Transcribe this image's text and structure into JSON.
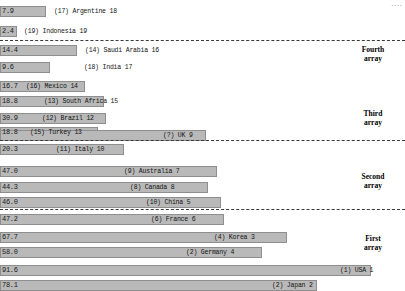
{
  "chart_data": {
    "type": "bar",
    "title": "",
    "xlabel": "",
    "ylabel": "",
    "orientation": "horizontal",
    "xlim": [
      0,
      100
    ],
    "grid": false,
    "legend": "none",
    "note_corner": "",
    "categories": [
      "Argentina",
      "Indonesia",
      "Saudi Arabia",
      "India",
      "Mexico",
      "South Africa",
      "Brazil",
      "Turkey",
      "UK",
      "Italy",
      "Australia",
      "Canada",
      "China",
      "France",
      "Korea",
      "Germany",
      "USA",
      "Japan"
    ],
    "values": [
      7.9,
      2.4,
      14.4,
      9.6,
      16.7,
      18.8,
      30.9,
      18.8,
      28.0,
      20.3,
      47.0,
      44.3,
      46.0,
      47.2,
      67.7,
      58.0,
      91.6,
      78.1
    ]
  },
  "rows": [
    {
      "value": "7.9",
      "label": "(17) Argentine 18",
      "bar_w": 46,
      "lbl_x": 54,
      "y": 6,
      "group": "fourth"
    },
    {
      "value": "2.4",
      "label": "(19) Indonesia 19",
      "bar_w": 17,
      "lbl_x": 24,
      "y": 26,
      "group": "fourth"
    },
    {
      "value": "14.4",
      "label": "(14) Saudi Arabia 16",
      "bar_w": 77,
      "lbl_x": 85,
      "y": 45,
      "group": "fourth"
    },
    {
      "value": "9.6",
      "label": "(18) India 17",
      "bar_w": 50,
      "lbl_x": 84,
      "y": 62,
      "group": "fourth"
    },
    {
      "value": "16.7",
      "label": "(16) Mexico 14",
      "bar_w": 85,
      "lbl_x": 26,
      "y": 81,
      "group": "third"
    },
    {
      "value": "18.8",
      "label": "(13) South Africa 15",
      "bar_w": 104,
      "lbl_x": 44,
      "y": 96,
      "group": "third"
    },
    {
      "value": "30.9",
      "label": "(12) Brazil 12",
      "bar_w": 106,
      "lbl_x": 42,
      "y": 113,
      "group": "third"
    },
    {
      "value": "18.8",
      "label": "(15) Turkey 13",
      "bar_w": 98,
      "lbl_x": 30,
      "y": 127,
      "group": "third"
    },
    {
      "value": "",
      "label": "(?) UK 9",
      "bar_w": 206,
      "lbl_x": 163,
      "y": 130,
      "group": "third"
    },
    {
      "value": "20.3",
      "label": "(11) Italy 10",
      "bar_w": 124,
      "lbl_x": 56,
      "y": 144,
      "group": "third"
    },
    {
      "value": "47.0",
      "label": "(9) Australia 7",
      "bar_w": 217,
      "lbl_x": 124,
      "y": 166,
      "group": "second"
    },
    {
      "value": "44.3",
      "label": "(8) Canada 8",
      "bar_w": 208,
      "lbl_x": 130,
      "y": 182,
      "group": "second"
    },
    {
      "value": "46.0",
      "label": "(10) China 5",
      "bar_w": 221,
      "lbl_x": 146,
      "y": 197,
      "group": "second"
    },
    {
      "value": "47.2",
      "label": "(6) France 6",
      "bar_w": 224,
      "lbl_x": 151,
      "y": 214,
      "group": "second"
    },
    {
      "value": "67.7",
      "label": "(4) Korea 3",
      "bar_w": 287,
      "lbl_x": 214,
      "y": 232,
      "group": "first"
    },
    {
      "value": "58.0",
      "label": "(2) Germany 4",
      "bar_w": 262,
      "lbl_x": 186,
      "y": 247,
      "group": "first"
    },
    {
      "value": "91.6",
      "label": "(1) USA 1",
      "bar_w": 371,
      "lbl_x": 340,
      "y": 265,
      "group": "first"
    },
    {
      "value": "78.1",
      "label": "(2) Japan 2",
      "bar_w": 317,
      "lbl_x": 272,
      "y": 280,
      "group": "first"
    }
  ],
  "separators": [
    {
      "y": 40
    },
    {
      "y": 140
    },
    {
      "y": 209
    }
  ],
  "array_labels": [
    {
      "line1": "Fourth",
      "line2": "array",
      "x": 345,
      "y": 45
    },
    {
      "line1": "Third",
      "line2": "array",
      "x": 345,
      "y": 109
    },
    {
      "line1": "Second",
      "line2": "array",
      "x": 345,
      "y": 172
    },
    {
      "line1": "First",
      "line2": "array",
      "x": 345,
      "y": 234
    }
  ],
  "corner_note": "...."
}
